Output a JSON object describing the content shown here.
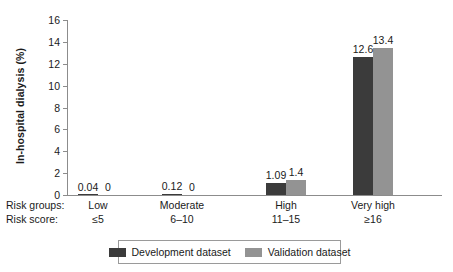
{
  "chart_data": {
    "type": "bar",
    "title": "",
    "xlabel": "",
    "ylabel": "In-hospital dialysis (%)",
    "ylim": [
      0,
      16
    ],
    "yticks": [
      0,
      2,
      4,
      6,
      8,
      10,
      12,
      14,
      16
    ],
    "grid": false,
    "legend_position": "bottom",
    "categories": [
      "Low",
      "Moderate",
      "High",
      "Very high"
    ],
    "category_row_labels": {
      "groups": "Risk groups:",
      "score": "Risk score:"
    },
    "risk_scores": [
      "≤5",
      "6–10",
      "11–15",
      "≥16"
    ],
    "series": [
      {
        "name": "Development dataset",
        "color": "#3b3b3b",
        "values": [
          0.04,
          0.12,
          1.09,
          12.6
        ],
        "labels": [
          "0.04",
          "0.12",
          "1.09",
          "12.6"
        ]
      },
      {
        "name": "Validation dataset",
        "color": "#939393",
        "values": [
          0,
          0,
          1.4,
          13.4
        ],
        "labels": [
          "0",
          "0",
          "1.4",
          "13.4"
        ]
      }
    ]
  }
}
